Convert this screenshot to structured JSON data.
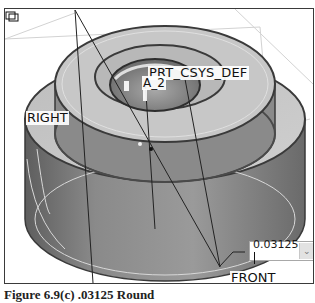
{
  "viewport": {
    "labels": {
      "right_plane": "RIGHT",
      "csys": "PRT_CSYS_DEF",
      "axis": "A_2",
      "front_plane": "FRONT"
    }
  },
  "dimension_input": {
    "value": "0.03125",
    "dropdown_icon": "chevron-down-icon"
  },
  "caption": {
    "text": "Figure 6.9(c) .03125 Round"
  },
  "colors": {
    "frame": "#3a3a3a",
    "model_shade_light": "#c9c9c9",
    "model_shade_dark": "#6e6e6e",
    "datum_plane_line": "#cfcfcf"
  }
}
